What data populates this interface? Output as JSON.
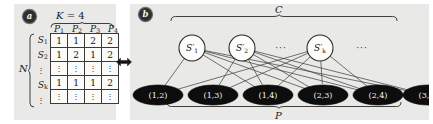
{
  "figure": {
    "panels": [
      {
        "id": "a",
        "badge": "a"
      },
      {
        "id": "b",
        "badge": "b"
      }
    ]
  },
  "panel_a": {
    "badge": "a",
    "k_label_symbol": "K",
    "k_label_eq": " = ",
    "k_label_value": "4",
    "n_label": "N",
    "column_headers": [
      {
        "symbol": "P",
        "sub": "1"
      },
      {
        "symbol": "P",
        "sub": "2"
      },
      {
        "symbol": "P",
        "sub": "3"
      },
      {
        "symbol": "P",
        "sub": "4"
      }
    ],
    "row_labels": [
      {
        "symbol": "S",
        "sub": "1",
        "type": "label"
      },
      {
        "symbol": "S",
        "sub": "2",
        "type": "label"
      },
      {
        "symbol": "⋮",
        "sub": "",
        "type": "dots"
      },
      {
        "symbol": "S",
        "sub": "k",
        "type": "label"
      },
      {
        "symbol": "⋮",
        "sub": "",
        "type": "dots"
      }
    ],
    "matrix_rows": [
      {
        "type": "values",
        "cells": [
          "1",
          "1",
          "2",
          "2"
        ]
      },
      {
        "type": "values",
        "cells": [
          "1",
          "2",
          "1",
          "2"
        ]
      },
      {
        "type": "dots",
        "cells": [
          "⋮",
          "⋮",
          "⋮",
          "⋮"
        ]
      },
      {
        "type": "values",
        "cells": [
          "1",
          "1",
          "1",
          "2"
        ]
      },
      {
        "type": "dots",
        "cells": [
          "⋮",
          "⋮",
          "⋮",
          "⋮"
        ]
      }
    ]
  },
  "connector": {
    "name": "bidirectional-arrow",
    "glyph": "↔"
  },
  "panel_b": {
    "badge": "b",
    "top_brace_label": "C",
    "bottom_brace_label": "P",
    "top_nodes": [
      {
        "symbol": "S",
        "prime": "′",
        "sub": "1",
        "cx": 62,
        "cy": 44,
        "r": 13
      },
      {
        "symbol": "S",
        "prime": "′",
        "sub": "2",
        "cx": 112,
        "cy": 44,
        "r": 13
      },
      {
        "symbol": "S",
        "prime": "′",
        "sub": "k",
        "cx": 190,
        "cy": 44,
        "r": 13
      }
    ],
    "top_ellipses": [
      {
        "text": "···",
        "x": 151,
        "y": 47
      },
      {
        "text": "···",
        "x": 232,
        "y": 47
      }
    ],
    "bottom_nodes": [
      {
        "label": "(1,2)",
        "cx": 28,
        "cy": 91,
        "rx": 25,
        "ry": 10
      },
      {
        "label": "(1,3)",
        "cx": 83,
        "cy": 91,
        "rx": 25,
        "ry": 10
      },
      {
        "label": "(1,4)",
        "cx": 138,
        "cy": 91,
        "rx": 25,
        "ry": 10
      },
      {
        "label": "(2,3)",
        "cx": 193,
        "cy": 91,
        "rx": 25,
        "ry": 10
      },
      {
        "label": "(2,4)",
        "cx": 248,
        "cy": 91,
        "rx": 25,
        "ry": 10
      },
      {
        "label": "(3,4)",
        "cx": 298,
        "cy": 91,
        "rx": 25,
        "ry": 10
      }
    ],
    "edges": [
      {
        "from": 0,
        "to": 0
      },
      {
        "from": 0,
        "to": 2
      },
      {
        "from": 0,
        "to": 3
      },
      {
        "from": 0,
        "to": 4
      },
      {
        "from": 0,
        "to": 5
      },
      {
        "from": 1,
        "to": 1
      },
      {
        "from": 1,
        "to": 2
      },
      {
        "from": 1,
        "to": 3
      },
      {
        "from": 1,
        "to": 4
      },
      {
        "from": 1,
        "to": 5
      },
      {
        "from": 2,
        "to": 0
      },
      {
        "from": 2,
        "to": 1
      },
      {
        "from": 2,
        "to": 2
      },
      {
        "from": 2,
        "to": 3
      },
      {
        "from": 2,
        "to": 4
      }
    ]
  },
  "colors": {
    "panel_background": "#e9e9e7",
    "page_background": "#ffffff",
    "node_fill_top": "#fdfdfc",
    "node_fill_bottom": "#0d0d0d",
    "stroke": "#2a2a28",
    "text_dark": "#141414",
    "text_light": "#f6f6f4"
  }
}
